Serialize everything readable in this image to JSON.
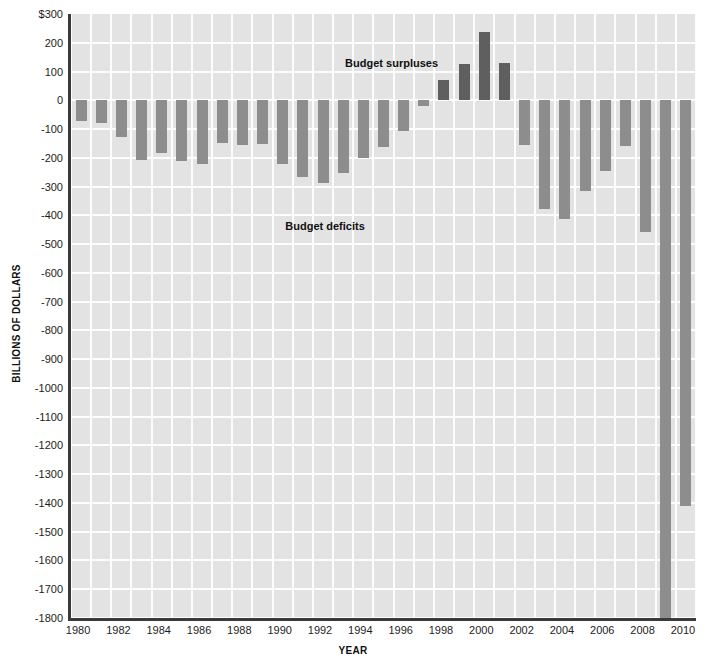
{
  "chart_data": {
    "type": "bar",
    "title": "",
    "xlabel": "YEAR",
    "ylabel": "BILLIONS OF DOLLARS",
    "ylim": [
      -1800,
      300
    ],
    "ytick_labels": [
      "$300",
      "200",
      "100",
      "0",
      "-100",
      "-200",
      "-300",
      "-400",
      "-500",
      "-600",
      "-700",
      "-800",
      "-900",
      "-1000",
      "-1100",
      "-1200",
      "-1300",
      "-1400",
      "-1500",
      "-1600",
      "-1700",
      "-1800"
    ],
    "ytick_values": [
      300,
      200,
      100,
      0,
      -100,
      -200,
      -300,
      -400,
      -500,
      -600,
      -700,
      -800,
      -900,
      -1000,
      -1100,
      -1200,
      -1300,
      -1400,
      -1500,
      -1600,
      -1700,
      -1800
    ],
    "xtick_labels": [
      "1980",
      "1982",
      "1984",
      "1986",
      "1988",
      "1990",
      "1992",
      "1994",
      "1996",
      "1998",
      "2000",
      "2002",
      "2004",
      "2006",
      "2008",
      "2010"
    ],
    "grid": true,
    "legend": "none",
    "categories": [
      1980,
      1981,
      1982,
      1983,
      1984,
      1985,
      1986,
      1987,
      1988,
      1989,
      1990,
      1991,
      1992,
      1993,
      1994,
      1995,
      1996,
      1997,
      1998,
      1999,
      2000,
      2001,
      2002,
      2003,
      2004,
      2005,
      2006,
      2007,
      2008,
      2009,
      2010
    ],
    "values": [
      -74,
      -79,
      -128,
      -208,
      -185,
      -212,
      -221,
      -150,
      -155,
      -153,
      -221,
      -269,
      -290,
      -255,
      -203,
      -164,
      -107,
      -22,
      69,
      126,
      236,
      128,
      -158,
      -378,
      -413,
      -318,
      -248,
      -161,
      -459,
      -1800,
      -1413
    ],
    "colors": {
      "deficit_bar": "#8d8d8d",
      "surplus_bar": "#5f5f5f",
      "plot_background": "#e3e3e3",
      "gridline": "#fdfdfd",
      "axis": "#3a3a3a",
      "text": "#1c1c1c"
    },
    "annotations": [
      {
        "text": "Budget surpluses",
        "year": 1995.4,
        "value": 130
      },
      {
        "text": "Budget deficits",
        "year": 1992.1,
        "value": -437
      }
    ],
    "notes": {
      "clipped_bar_year": 2009,
      "clipped_bar_note": "extends below axis minimum"
    }
  }
}
